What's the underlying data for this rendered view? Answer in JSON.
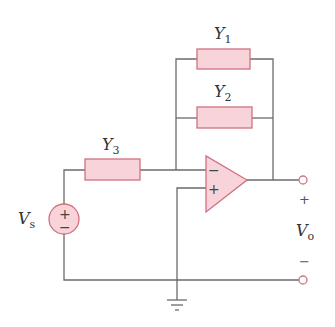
{
  "diagram": {
    "type": "op-amp circuit",
    "components": {
      "Y1": {
        "label": "Y",
        "subscript": "1",
        "type": "admittance",
        "position": "feedback-top"
      },
      "Y2": {
        "label": "Y",
        "subscript": "2",
        "type": "admittance",
        "position": "feedback-bottom"
      },
      "Y3": {
        "label": "Y",
        "subscript": "3",
        "type": "admittance",
        "position": "input-series"
      },
      "opamp": {
        "inverting_sign": "−",
        "noninverting_sign": "+"
      },
      "source": {
        "label": "V",
        "subscript": "s",
        "plus": "+",
        "minus": "−"
      },
      "output": {
        "label": "V",
        "subscript": "o",
        "plus": "+",
        "minus": "−"
      }
    },
    "colors": {
      "component_fill": "#f9d3da",
      "component_stroke": "#d0707e",
      "wire": "#6b6b6b"
    }
  }
}
